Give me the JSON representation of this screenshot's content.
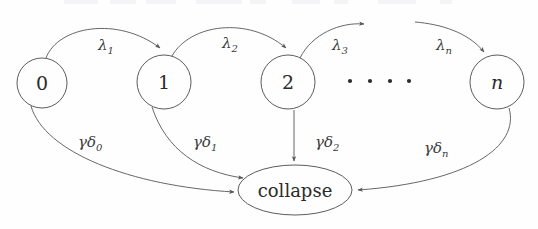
{
  "figure": {
    "kind": "markov-chain-state-transition-diagram",
    "background_color": "#fefefe",
    "stroke_color": "#55565a",
    "text_color": "#2b2b2b",
    "width": 538,
    "height": 229
  },
  "nodes": [
    {
      "id": "0",
      "label": "0",
      "shape": "circle",
      "cx": 42,
      "cy": 83,
      "r": 25,
      "italic": false
    },
    {
      "id": "1",
      "label": "1",
      "shape": "circle",
      "cx": 164,
      "cy": 82,
      "r": 27,
      "italic": false
    },
    {
      "id": "2",
      "label": "2",
      "shape": "circle",
      "cx": 288,
      "cy": 82,
      "r": 27,
      "italic": false
    },
    {
      "id": "n",
      "label": "n",
      "shape": "circle",
      "cx": 497,
      "cy": 82,
      "r": 27,
      "italic": true
    },
    {
      "id": "collapse",
      "label": "collapse",
      "shape": "ellipse",
      "cx": 295,
      "cy": 190,
      "rx": 57,
      "ry": 25,
      "italic": false
    }
  ],
  "ellipsis": {
    "name": "horizontal-ellipsis",
    "dot_count": 4,
    "dots_x": [
      350,
      370,
      390,
      409
    ],
    "dots_y": 81,
    "dot_radius": 2.1
  },
  "transitions": [
    {
      "id": "lambda-1",
      "from": "0",
      "to": "1",
      "label_base": "λ",
      "label_sub": "1",
      "label_x": 98,
      "label_y": 50
    },
    {
      "id": "lambda-2",
      "from": "1",
      "to": "2",
      "label_base": "λ",
      "label_sub": "2",
      "label_x": 222,
      "label_y": 48
    },
    {
      "id": "lambda-3",
      "from": "2",
      "to": "ellipsis",
      "label_base": "λ",
      "label_sub": "3",
      "label_x": 332,
      "label_y": 50
    },
    {
      "id": "lambda-n",
      "from": "ellipsis",
      "to": "n",
      "label_base": "λ",
      "label_sub": "n",
      "label_x": 436,
      "label_y": 50
    },
    {
      "id": "gamma-delta-0",
      "from": "0",
      "to": "collapse",
      "label_base": "γδ",
      "label_sub": "0",
      "label_x": 78,
      "label_y": 147
    },
    {
      "id": "gamma-delta-1",
      "from": "1",
      "to": "collapse",
      "label_base": "γδ",
      "label_sub": "1",
      "label_x": 193,
      "label_y": 147
    },
    {
      "id": "gamma-delta-2",
      "from": "2",
      "to": "collapse",
      "label_base": "γδ",
      "label_sub": "2",
      "label_x": 315,
      "label_y": 147
    },
    {
      "id": "gamma-delta-n",
      "from": "n",
      "to": "collapse",
      "label_base": "γδ",
      "label_sub": "n",
      "label_x": 424,
      "label_y": 153
    }
  ]
}
